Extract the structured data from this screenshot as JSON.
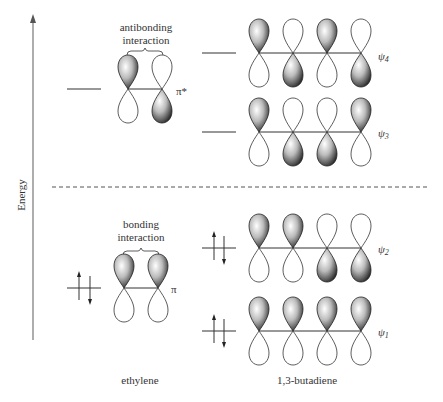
{
  "axis": {
    "label": "Energy"
  },
  "ethylene": {
    "name": "ethylene",
    "antibonding": {
      "label_line1": "antibonding",
      "label_line2": "interaction",
      "orbital_label": "π*"
    },
    "bonding": {
      "label_line1": "bonding",
      "label_line2": "interaction",
      "orbital_label": "π"
    }
  },
  "butadiene": {
    "name": "1,3-butadiene",
    "levels": [
      {
        "label": "ψ",
        "sub": "4"
      },
      {
        "label": "ψ",
        "sub": "3"
      },
      {
        "label": "ψ",
        "sub": "2"
      },
      {
        "label": "ψ",
        "sub": "1"
      }
    ]
  },
  "colors": {
    "line": "#333333",
    "lobe_fill_dark": "#222222",
    "lobe_fill_light": "#f2f2f2",
    "axis": "#777777"
  }
}
